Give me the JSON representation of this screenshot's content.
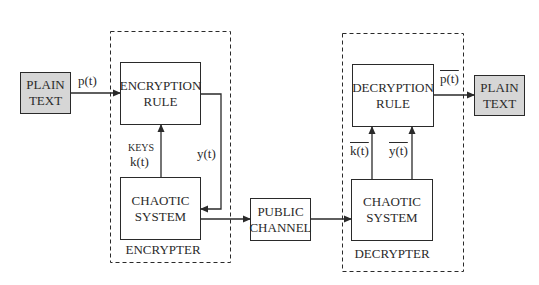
{
  "diagram": {
    "type": "block-diagram",
    "title": "",
    "colors": {
      "line": "#2a2a2a",
      "terminal_fill": "#d6d6d6",
      "box_fill": "#ffffff"
    },
    "blocks": {
      "plaintext_in": {
        "line1": "PLAIN",
        "line2": "TEXT"
      },
      "encryption_rule": {
        "line1": "ENCRYPTION",
        "line2": "RULE"
      },
      "chaotic_enc": {
        "line1": "CHAOTIC",
        "line2": "SYSTEM"
      },
      "public_channel": {
        "line1": "PUBLIC",
        "line2": "CHANNEL"
      },
      "decryption_rule": {
        "line1": "DECRYPTION",
        "line2": "RULE"
      },
      "chaotic_dec": {
        "line1": "CHAOTIC",
        "line2": "SYSTEM"
      },
      "plaintext_out": {
        "line1": "PLAIN",
        "line2": "TEXT"
      }
    },
    "groups": {
      "encrypter": "ENCRYPTER",
      "decrypter": "DECRYPTER"
    },
    "signals": {
      "p": "p(t)",
      "keys_label": "KEYS",
      "k": "k(t)",
      "y": "y(t)",
      "k_bar": "k(t)",
      "y_bar": "y(t)",
      "p_bar": "p(t)"
    },
    "edges": [
      {
        "from": "PLAIN TEXT",
        "to": "ENCRYPTION RULE",
        "label": "p(t)"
      },
      {
        "from": "CHAOTIC SYSTEM (encrypter)",
        "to": "ENCRYPTION RULE",
        "label": "KEYS k(t)"
      },
      {
        "from": "ENCRYPTION RULE",
        "to": "CHAOTIC SYSTEM (encrypter)",
        "label": "y(t)"
      },
      {
        "from": "CHAOTIC SYSTEM (encrypter)",
        "to": "PUBLIC CHANNEL",
        "label": ""
      },
      {
        "from": "PUBLIC CHANNEL",
        "to": "CHAOTIC SYSTEM (decrypter)",
        "label": ""
      },
      {
        "from": "CHAOTIC SYSTEM (decrypter)",
        "to": "DECRYPTION RULE",
        "label": "k̄(t)"
      },
      {
        "from": "CHAOTIC SYSTEM (decrypter)",
        "to": "DECRYPTION RULE",
        "label": "ȳ(t)"
      },
      {
        "from": "DECRYPTION RULE",
        "to": "PLAIN TEXT",
        "label": "p̄(t)"
      }
    ]
  }
}
